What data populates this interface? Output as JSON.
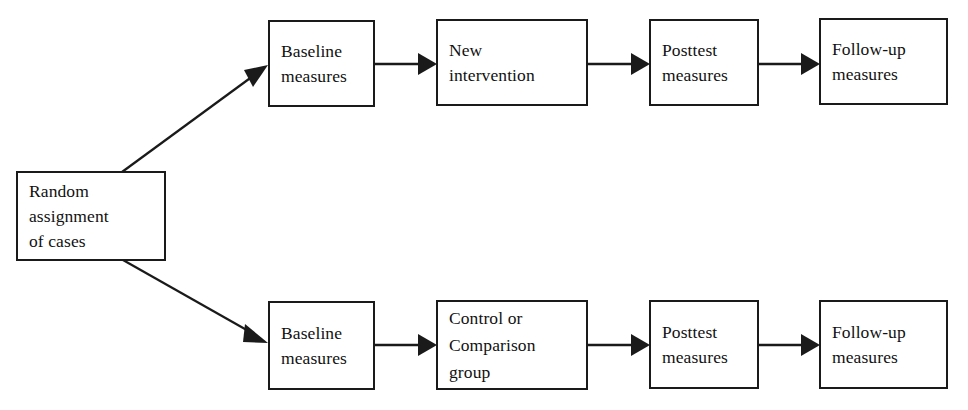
{
  "diagram": {
    "type": "flowchart",
    "background_color": "#ffffff",
    "line_color": "#1a1a1a",
    "text_color": "#111111",
    "nodes": {
      "root": {
        "id": "random-assignment",
        "label": "Random\nassignment\nof cases"
      },
      "top": [
        {
          "id": "top-baseline",
          "label": "Baseline\nmeasures"
        },
        {
          "id": "top-treatment",
          "label": "New\nintervention"
        },
        {
          "id": "top-posttest",
          "label": "Posttest\nmeasures"
        },
        {
          "id": "top-followup",
          "label": "Follow-up\nmeasures"
        }
      ],
      "bottom": [
        {
          "id": "bottom-baseline",
          "label": "Baseline\nmeasures"
        },
        {
          "id": "bottom-control",
          "label": "Control or\nComparison\ngroup"
        },
        {
          "id": "bottom-posttest",
          "label": "Posttest\nmeasures"
        },
        {
          "id": "bottom-followup",
          "label": "Follow-up\nmeasures"
        }
      ]
    },
    "edges": [
      {
        "id": "edge-root-to-top",
        "from": "random-assignment",
        "to": "top-baseline",
        "style": "diagonal-arrow"
      },
      {
        "id": "edge-root-to-bottom",
        "from": "random-assignment",
        "to": "bottom-baseline",
        "style": "diagonal-arrow"
      },
      {
        "id": "edge-top-baseline-treatment",
        "from": "top-baseline",
        "to": "top-treatment",
        "style": "horizontal-arrow"
      },
      {
        "id": "edge-top-treatment-posttest",
        "from": "top-treatment",
        "to": "top-posttest",
        "style": "horizontal-arrow"
      },
      {
        "id": "edge-top-posttest-followup",
        "from": "top-posttest",
        "to": "top-followup",
        "style": "horizontal-arrow"
      },
      {
        "id": "edge-bottom-baseline-control",
        "from": "bottom-baseline",
        "to": "bottom-control",
        "style": "horizontal-arrow"
      },
      {
        "id": "edge-bottom-control-posttest",
        "from": "bottom-control",
        "to": "bottom-posttest",
        "style": "horizontal-arrow"
      },
      {
        "id": "edge-bottom-posttest-followup",
        "from": "bottom-posttest",
        "to": "bottom-followup",
        "style": "horizontal-arrow"
      }
    ]
  }
}
